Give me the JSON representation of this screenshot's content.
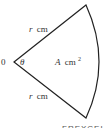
{
  "diagram": {
    "type": "sector",
    "center_label": "0",
    "angle_label": "θ",
    "upper_radius_label": {
      "var": "r",
      "unit": "cm"
    },
    "lower_radius_label": {
      "var": "r",
      "unit": "cm"
    },
    "area_label": {
      "var": "A",
      "unit": "cm",
      "sup": "2"
    },
    "watermark_fragment": "FREXCEL",
    "stroke_color": "#222222"
  }
}
